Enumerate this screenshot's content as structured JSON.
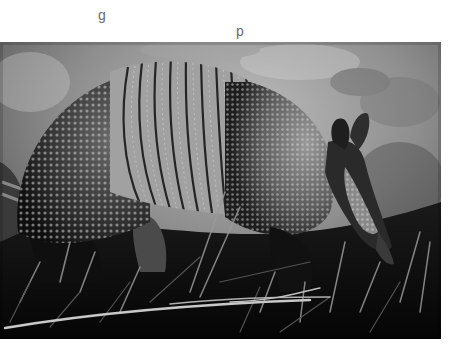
{
  "top_text_fragments": {
    "left": "g",
    "right": "p"
  },
  "photo": {
    "subject": "nine-banded armadillo",
    "alt": "Grayscale photo of a nine-banded armadillo foraging in grass",
    "tone": "grayscale",
    "colors": {
      "background_light": "#b4b4b4",
      "background_mid": "#8a8a8a",
      "shell_dark": "#2a2a2a",
      "shell_light": "#c8c8c8",
      "grass_dark": "#0c0c0c",
      "grass_light": "#a0a0a0"
    }
  }
}
